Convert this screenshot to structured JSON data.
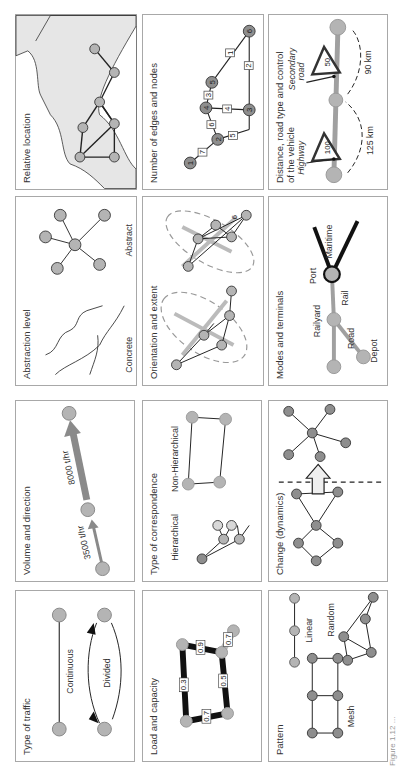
{
  "figure": {
    "orientation": "rotated 90 degrees counter-clockwise",
    "caption": "Figure 1.12 ..."
  },
  "panels": {
    "relative_location": {
      "title": "Relative location"
    },
    "number_edges_nodes": {
      "title": "Number of edges and nodes",
      "nodes": [
        "1",
        "2",
        "3",
        "4",
        "5",
        "6"
      ],
      "edges": [
        {
          "from": "1",
          "to": "2",
          "label": "7"
        },
        {
          "from": "2",
          "to": "4",
          "label": "6"
        },
        {
          "from": "2",
          "to": "3",
          "label": "5"
        },
        {
          "from": "4",
          "to": "3",
          "label": "4"
        },
        {
          "from": "4",
          "to": "5",
          "label": "3"
        },
        {
          "from": "3",
          "to": "6",
          "label": "2"
        },
        {
          "from": "5",
          "to": "6",
          "label": "1"
        }
      ]
    },
    "distance_road": {
      "title_line1": "Distance, road type and control",
      "title_line2": "of the vehicle",
      "highway_label": "Highway",
      "highway_speed": "100",
      "highway_distance": "125 km",
      "secondary_label_1": "Secondary",
      "secondary_label_2": "road",
      "secondary_speed": "50",
      "secondary_distance": "90 km"
    },
    "abstraction_level": {
      "title": "Abstraction level",
      "concrete_label": "Concrete",
      "abstract_label": "Abstract"
    },
    "orientation_extent": {
      "title": "Orientation and extent"
    },
    "modes_terminals": {
      "title": "Modes and terminals",
      "port": "Port",
      "maritime": "Maritime",
      "rail": "Rail",
      "railyard": "Railyard",
      "road": "Road",
      "depot": "Depot"
    },
    "volume_direction": {
      "title": "Volume and direction",
      "flow1": "3500 t/hr",
      "flow2": "8000 t/hr"
    },
    "type_correspondence": {
      "title": "Type of correspondence",
      "hierarchical": "Hierarchical",
      "non_hierarchical": "Non-Hierarchical"
    },
    "change_dynamics": {
      "title": "Change (dynamics)"
    },
    "type_traffic": {
      "title": "Type of traffic",
      "continuous": "Continuous",
      "divided": "Divided"
    },
    "load_capacity": {
      "title": "Load and capacity",
      "edge_loads": [
        "0.3",
        "0.7",
        "0.5",
        "0.9",
        "0.7"
      ]
    },
    "pattern": {
      "title": "Pattern",
      "linear": "Linear",
      "mesh": "Mesh",
      "random": "Random"
    }
  },
  "colors": {
    "node_fill": "#b4b4b4",
    "node_fill_dark": "#8e8e8e",
    "node_fill_light": "#d8d8d8",
    "land_fill": "#e6e6e6",
    "border": "#a8a8a8",
    "edge": "#222222",
    "grey_route": "#a0a0a0"
  }
}
